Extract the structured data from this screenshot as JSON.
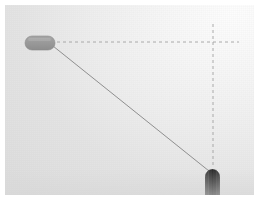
{
  "scene": {
    "title": "Two-vessel bearing diagram",
    "canvas": {
      "width": 249,
      "height": 190,
      "border_px": 5
    },
    "background": {
      "type": "gradient",
      "light_corner": "top-right",
      "light_color": "#fdfdfd",
      "dark_color": "#dedede",
      "border_color": "#ffffff"
    },
    "objects": [
      {
        "id": "object-light",
        "label": "Light pill-shaped object",
        "shape": "rounded-capsule",
        "fill": "#9a9a9a",
        "stroke": "#8c8c8c",
        "x": 20,
        "y": 31,
        "width": 30,
        "height": 14,
        "corner_radius": 7,
        "orientation": "horizontal"
      },
      {
        "id": "object-dark",
        "label": "Dark bullet-shaped object",
        "shape": "bullet",
        "fill": "#3b3b3b",
        "stroke": "#2c2c2c",
        "x": 200,
        "y": 164,
        "width": 15,
        "height": 31,
        "corner_radius": 7,
        "orientation": "vertical"
      }
    ],
    "connector": {
      "id": "line-of-sight",
      "label": "Line of sight",
      "style": "solid",
      "color": "#8f8f8f",
      "width_px": 1,
      "from": {
        "x": 48,
        "y": 41
      },
      "to": {
        "x": 204,
        "y": 166
      }
    },
    "reference_lines": [
      {
        "id": "horizontal-reference",
        "label": "Horizontal reference line",
        "orientation": "horizontal",
        "style": "dashed",
        "color": "#9d9d9d",
        "dash": "3 3",
        "from": {
          "x": 52,
          "y": 37
        },
        "to": {
          "x": 234,
          "y": 37
        }
      },
      {
        "id": "vertical-reference",
        "label": "Vertical reference line",
        "orientation": "vertical",
        "style": "dashed",
        "color": "#9d9d9d",
        "dash": "3 3",
        "from": {
          "x": 208,
          "y": 19
        },
        "to": {
          "x": 208,
          "y": 163
        }
      }
    ],
    "intersection": {
      "x": 208,
      "y": 37
    }
  }
}
